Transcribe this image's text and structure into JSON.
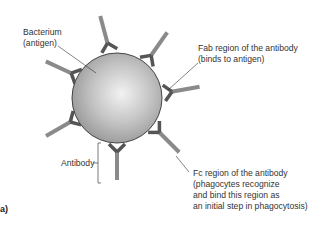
{
  "labels": {
    "bacterium_line1": "Bacterium",
    "bacterium_line2": "(antigen)",
    "fab_line1": "Fab region of the antibody",
    "fab_line2": "(binds to antigen)",
    "antibody": "Antibody",
    "fc_line1": "Fc region of the antibody",
    "fc_line2": "(phagocytes recognize",
    "fc_line3": "and bind this region as",
    "fc_line4": "an initial step in phagocytosis)",
    "panel": "a)"
  },
  "colors": {
    "sphere_light": "#e6e6e6",
    "sphere_dark": "#8e8e8e",
    "antibody_fab": "#5a5a5a",
    "antibody_fc": "#8a8a8a",
    "text": "#333333"
  }
}
